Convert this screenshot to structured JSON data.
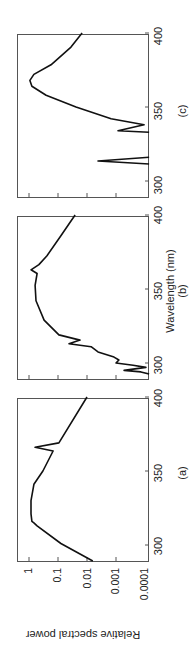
{
  "chart_data": [
    {
      "type": "line",
      "panel_label": "(a)",
      "xlabel": "",
      "ylabel": "Relative spectral power",
      "xlim": [
        289,
        401
      ],
      "ylim": [
        0.0001,
        2.5
      ],
      "yscale": "log",
      "xticks": [
        300,
        350,
        400
      ],
      "yticks": [
        "1",
        "0.1",
        "0.01",
        "0.001",
        "0.0001"
      ],
      "grid": false,
      "series": [
        {
          "name": "a",
          "x": [
            289,
            301,
            313,
            315,
            316,
            321,
            330,
            341,
            350,
            363.5,
            366,
            369,
            400
          ],
          "log10_y": [
            -2.2,
            -1.1,
            -0.28,
            -0.17,
            -0.1,
            -0.07,
            -0.07,
            -0.17,
            -0.48,
            -0.83,
            -0.21,
            -1.03,
            -2.0
          ]
        }
      ]
    },
    {
      "type": "line",
      "panel_label": "(b)",
      "xlabel": "Wavelength (nm)",
      "ylabel": "",
      "xlim": [
        289,
        401
      ],
      "ylim": [
        0.0001,
        2.5
      ],
      "yscale": "log",
      "xticks": [
        300,
        350,
        400
      ],
      "grid": false,
      "series": [
        {
          "name": "b",
          "x": [
            292.5,
            294,
            295,
            297,
            298.5,
            300,
            302,
            304,
            307.5,
            311,
            313,
            315.5,
            319,
            329,
            342,
            352.5,
            360.5,
            363,
            366.5,
            372.5,
            386,
            400
          ],
          "log10_y": [
            -4.14,
            -3.86,
            -3.28,
            -4.03,
            -3.59,
            -3.0,
            -3.1,
            -2.93,
            -2.38,
            -2.14,
            -1.38,
            -1.76,
            -1.03,
            -0.52,
            -0.24,
            -0.21,
            -0.28,
            -0.07,
            -0.34,
            -0.62,
            -1.1,
            -1.59
          ]
        }
      ]
    },
    {
      "type": "line",
      "panel_label": "(c)",
      "xlabel": "",
      "ylabel": "",
      "xlim": [
        289,
        401
      ],
      "ylim": [
        0.0001,
        2.5
      ],
      "yscale": "log",
      "xticks": [
        300,
        350,
        400
      ],
      "grid": false,
      "series": [
        {
          "name": "c",
          "x": [
            311.5,
            313.5,
            316,
            333,
            334,
            338,
            342,
            350,
            358,
            364,
            368,
            372,
            378.5,
            390.5,
            401
          ],
          "log10_y": [
            -4.14,
            -2.38,
            -4.14,
            -4.14,
            -3.07,
            -3.97,
            -2.83,
            -1.62,
            -0.59,
            -0.1,
            -0.03,
            -0.17,
            -0.76,
            -1.45,
            -1.83
          ],
          "breaks_after_index": [
            2
          ]
        }
      ]
    }
  ],
  "figure": {
    "ylabel": "Relative spectral power",
    "xlabel": "Wavelength (nm)",
    "ytick_labels": [
      "1",
      "0.1",
      "0.01",
      "0.001",
      "0.0001"
    ],
    "xtick_labels": [
      "300",
      "350",
      "400"
    ],
    "panels": [
      {
        "label": "(a)",
        "left": 93
      },
      {
        "label": "(b)",
        "left": 275
      },
      {
        "label": "(c)",
        "left": 457
      }
    ]
  }
}
